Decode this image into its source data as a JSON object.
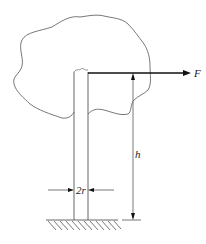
{
  "diagram": {
    "force_label": "F",
    "height_label": "h",
    "diameter_label": "2r",
    "colors": {
      "line": "#555555",
      "arrow": "#111111",
      "background": "#ffffff"
    }
  }
}
